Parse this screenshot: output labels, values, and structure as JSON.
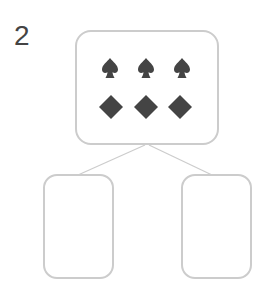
{
  "problem_number": "2",
  "colors": {
    "border": "#cccccc",
    "symbol": "#444444",
    "text": "#444444",
    "line": "#cccccc"
  },
  "parent": {
    "rows": [
      {
        "suit": "spade",
        "count": 3
      },
      {
        "suit": "diamond",
        "count": 3
      }
    ]
  },
  "children": [
    {
      "position": "left",
      "content": ""
    },
    {
      "position": "right",
      "content": ""
    }
  ]
}
